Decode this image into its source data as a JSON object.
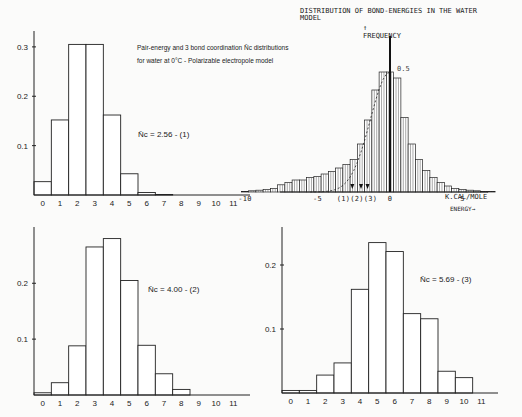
{
  "caption": {
    "line1": "Pair-energy and 3 bond coordination N̄c distributions",
    "line2": "for water at 0°C - Polarizable electropole model"
  },
  "chart_data": [
    {
      "id": "coord-1",
      "type": "bar",
      "title": "",
      "annotation": "N̄c = 2.56  - (1)",
      "xlabel": "",
      "ylabel": "",
      "categories": [
        "0",
        "1",
        "2",
        "3",
        "4",
        "5",
        "6",
        "7",
        "8",
        "9",
        "10",
        "11"
      ],
      "values": [
        0.027,
        0.152,
        0.305,
        0.305,
        0.162,
        0.043,
        0.005,
        0.001,
        0,
        0,
        0,
        0
      ],
      "yticks": [
        "0.1",
        "0.2",
        "0.3"
      ],
      "ylim": [
        0,
        0.32
      ],
      "grid": false
    },
    {
      "id": "bond-energy",
      "type": "bar",
      "title": "DISTRIBUTION OF BOND-ENERGIES IN THE WATER MODEL",
      "ylabel": "FREQUENCY",
      "xlabel": "K.CAL/MOLE",
      "xlabel2": "ENERGY",
      "peak_label": "0.5",
      "xticks": [
        "-10",
        "-5",
        "0",
        "5"
      ],
      "markers": [
        "(1)",
        "(2)",
        "(3)"
      ],
      "xlim": [
        -11,
        11
      ],
      "x": [
        -10,
        -9.5,
        -9,
        -8.5,
        -8,
        -7.5,
        -7,
        -6.5,
        -6,
        -5.5,
        -5,
        -4.5,
        -4,
        -3.5,
        -3,
        -2.5,
        -2,
        -1.5,
        -1,
        -0.5,
        0,
        0.5,
        1,
        1.5,
        2,
        2.5,
        3,
        3.5,
        4,
        4.5,
        5,
        5.5,
        6,
        6.5,
        7
      ],
      "values": [
        0.005,
        0.01,
        0.015,
        0.02,
        0.03,
        0.06,
        0.08,
        0.1,
        0.1,
        0.12,
        0.13,
        0.15,
        0.17,
        0.2,
        0.23,
        0.27,
        0.4,
        0.6,
        0.85,
        1.0,
        1.0,
        0.95,
        0.62,
        0.4,
        0.27,
        0.18,
        0.12,
        0.08,
        0.05,
        0.03,
        0.02,
        0.015,
        0.01,
        0.005,
        0.003
      ],
      "grid": false
    },
    {
      "id": "coord-2",
      "type": "bar",
      "annotation": "N̄c = 4.00  - (2)",
      "categories": [
        "0",
        "1",
        "2",
        "3",
        "4",
        "5",
        "6",
        "7",
        "8",
        "9",
        "10",
        "11"
      ],
      "values": [
        0.004,
        0.022,
        0.088,
        0.265,
        0.28,
        0.205,
        0.089,
        0.038,
        0.01,
        0,
        0,
        0
      ],
      "yticks": [
        "0.1",
        "0.2"
      ],
      "ylim": [
        0,
        0.29
      ],
      "grid": false
    },
    {
      "id": "coord-3",
      "type": "bar",
      "annotation": "N̄c = 5.69  - (3)",
      "categories": [
        "0",
        "1",
        "2",
        "3",
        "4",
        "5",
        "6",
        "7",
        "8",
        "9",
        "10",
        "11"
      ],
      "values": [
        0.004,
        0.004,
        0.028,
        0.047,
        0.162,
        0.235,
        0.221,
        0.124,
        0.116,
        0.034,
        0.024,
        0
      ],
      "yticks": [
        "0.1",
        "0.2"
      ],
      "ylim": [
        0,
        0.25
      ],
      "grid": false
    }
  ]
}
